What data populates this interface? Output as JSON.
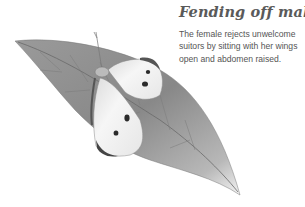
{
  "caption": {
    "title": "Fending off males",
    "body": "The female rejects unwelcome suitors by sitting with her wings open and abdomen raised."
  },
  "illustration": {
    "subject": "butterfly-on-leaf",
    "style": "pencil-drawing-grayscale",
    "colors": {
      "leaf": "#8a8a8a",
      "leaf_light": "#c4c4c4",
      "wing": "#f2f2f2",
      "spot": "#2a2a2a",
      "text": "#555555"
    }
  }
}
